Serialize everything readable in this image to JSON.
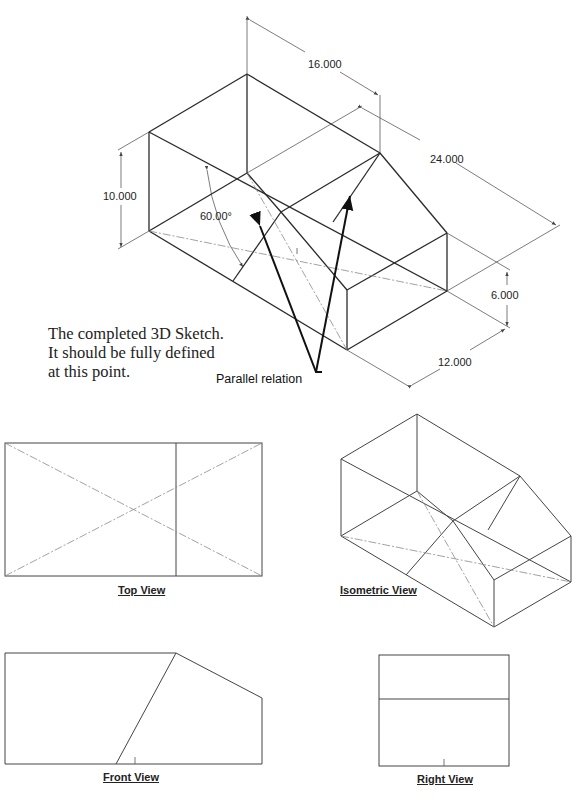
{
  "main_sketch": {
    "dimensions": {
      "width_top": "16.000",
      "length": "24.000",
      "height_left": "10.000",
      "height_right": "6.000",
      "depth": "12.000",
      "angle": "60.00°"
    },
    "caption_lines": [
      "The completed 3D Sketch.",
      "It should be fully defined",
      "at this point."
    ],
    "callout": "Parallel relation"
  },
  "views": {
    "top": {
      "label": "Top View"
    },
    "isometric": {
      "label": "Isometric View"
    },
    "front": {
      "label": "Front View"
    },
    "right": {
      "label": "Right View"
    }
  },
  "colors": {
    "line": "#2a2a2a",
    "construction": "#8a8a8a",
    "background": "#ffffff"
  }
}
